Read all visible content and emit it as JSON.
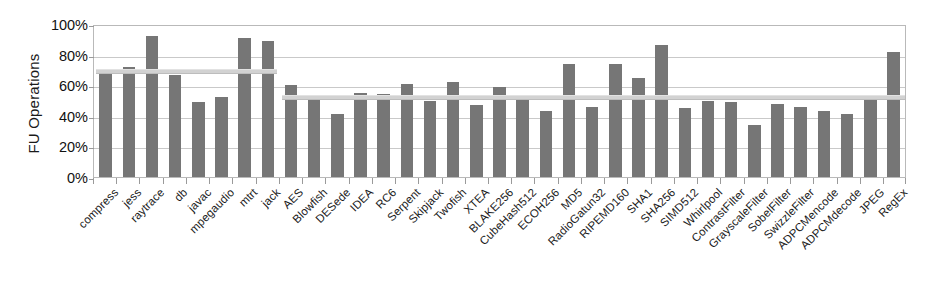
{
  "chart_data": {
    "type": "bar",
    "title": "",
    "xlabel": "",
    "ylabel": "FU Operations",
    "ylim": [
      0,
      100
    ],
    "ytick_labels": [
      "100%",
      "80%",
      "60%",
      "40%",
      "20%",
      "0%"
    ],
    "ytick_values": [
      100,
      80,
      60,
      40,
      20,
      0
    ],
    "grid": true,
    "legend": "none",
    "value_unit": "%",
    "bar_color": "#767676",
    "average_line_color": "#d2d2d2",
    "plot_border_color": "#b9b9b9",
    "gridline_color": "#c9c9c9",
    "categories": [
      "compress",
      "jess",
      "raytrace",
      "db",
      "javac",
      "mpegaudio",
      "mtrt",
      "jack",
      "AES",
      "Blowfish",
      "DESede",
      "IDEA",
      "RC6",
      "Serpent",
      "Skipjack",
      "Twofish",
      "XTEA",
      "BLAKE256",
      "CubeHash512",
      "ECOH256",
      "MD5",
      "RadioGatun32",
      "RIPEMD160",
      "SHA1",
      "SHA256",
      "SIMD512",
      "Whirlpool",
      "ContrastFilter",
      "GrayscaleFilter",
      "SobelFilter",
      "SwizzleFilter",
      "ADPCMencode",
      "ADPCMdecode",
      "JPEG",
      "RegEx"
    ],
    "values": [
      70,
      72,
      92,
      67,
      49,
      52,
      91,
      89,
      60,
      53,
      41,
      55,
      54,
      61,
      50,
      62,
      47,
      59,
      51,
      43,
      74,
      46,
      74,
      65,
      86,
      45,
      50,
      49,
      34,
      48,
      46,
      43,
      41,
      53,
      82
    ],
    "annotations": [
      {
        "name": "average-line-java",
        "label": "average",
        "value": 71,
        "span_categories": [
          "compress",
          "jack"
        ],
        "start_index": 0,
        "end_index": 7
      },
      {
        "name": "average-line-native",
        "label": "average",
        "value": 54,
        "span_categories": [
          "AES",
          "RegEx"
        ],
        "start_index": 8,
        "end_index": 34
      }
    ]
  }
}
